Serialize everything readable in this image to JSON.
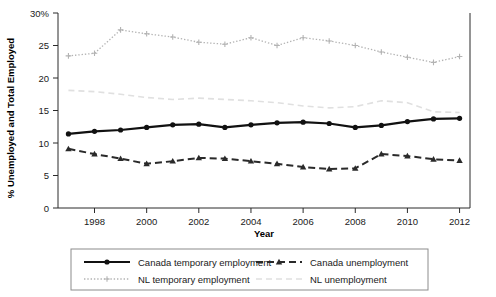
{
  "chart_data": {
    "type": "line",
    "title": "",
    "xlabel": "Year",
    "ylabel": "% Unemployed and Total Employed",
    "x": [
      1997,
      1998,
      1999,
      2000,
      2001,
      2002,
      2003,
      2004,
      2005,
      2006,
      2007,
      2008,
      2009,
      2010,
      2011,
      2012
    ],
    "xlim": [
      1996.6,
      2012.4
    ],
    "ylim": [
      0,
      30
    ],
    "xticks": [
      1998,
      2000,
      2002,
      2004,
      2006,
      2008,
      2010,
      2012
    ],
    "xtick_labels": [
      "1998",
      "2000",
      "2002",
      "2004",
      "2006",
      "2008",
      "2010",
      "2012"
    ],
    "yticks": [
      0,
      5,
      10,
      15,
      20,
      25,
      30
    ],
    "ytick_labels": [
      "0",
      "5",
      "10",
      "15",
      "20",
      "25",
      "30%"
    ],
    "grid": false,
    "legend_position": "bottom",
    "series": [
      {
        "name": "Canada temporary employment",
        "style": "solid-marker-circle",
        "color": "#111111",
        "values": [
          11.4,
          11.8,
          12.0,
          12.4,
          12.8,
          12.9,
          12.4,
          12.8,
          13.1,
          13.2,
          13.0,
          12.4,
          12.7,
          13.3,
          13.7,
          13.8
        ]
      },
      {
        "name": "Canada unemployment",
        "style": "dashed-marker-triangle",
        "color": "#2a2a2a",
        "values": [
          9.1,
          8.3,
          7.6,
          6.8,
          7.2,
          7.7,
          7.6,
          7.2,
          6.8,
          6.3,
          6.0,
          6.1,
          8.3,
          8.0,
          7.5,
          7.3
        ]
      },
      {
        "name": "NL temporary employment",
        "style": "dotted-marker-plus",
        "color": "#b3b3b3",
        "values": [
          23.4,
          23.8,
          27.4,
          26.8,
          26.3,
          25.5,
          25.2,
          26.2,
          25.0,
          26.2,
          25.7,
          25.0,
          24.0,
          23.2,
          22.4,
          23.3
        ]
      },
      {
        "name": "NL unemployment",
        "style": "solid-faint",
        "color": "#e0e0e0",
        "values": [
          18.1,
          17.9,
          17.5,
          17.0,
          16.7,
          16.9,
          16.7,
          16.5,
          16.2,
          15.7,
          15.4,
          15.6,
          16.5,
          16.2,
          14.8,
          14.7
        ]
      }
    ]
  },
  "legend": {
    "entries": [
      {
        "label": "Canada temporary employment"
      },
      {
        "label": "Canada unemployment"
      },
      {
        "label": "NL temporary employment"
      },
      {
        "label": "NL unemployment"
      }
    ]
  },
  "axes": {
    "x_title": "Year",
    "y_title": "% Unemployed and Total Employed"
  }
}
